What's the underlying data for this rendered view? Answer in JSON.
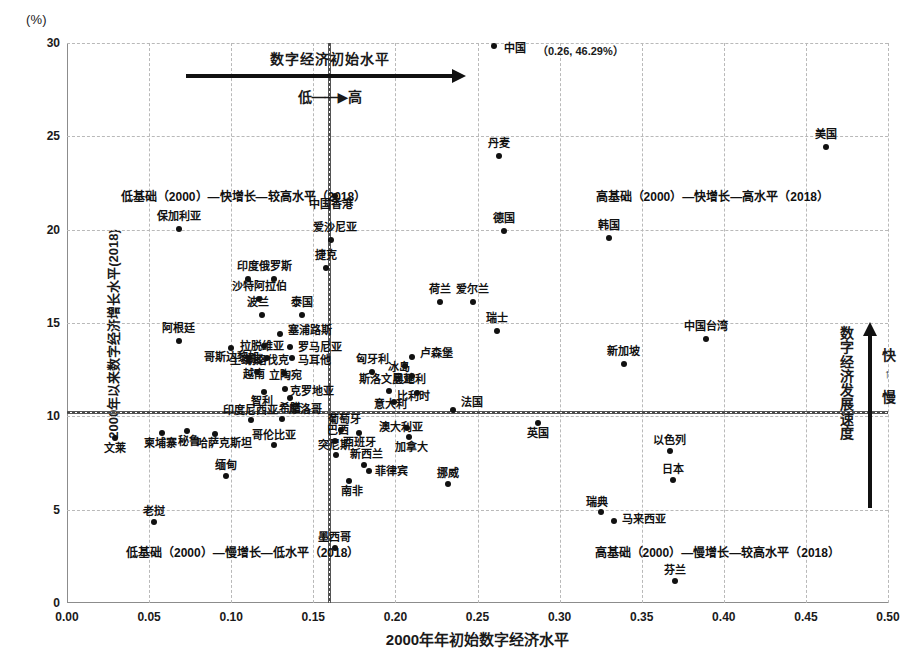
{
  "unit_label": "(%)",
  "axis": {
    "x_title": "2000年年初始数字经济水平",
    "y_title": "2000年以来数字经济增长水平(2018)",
    "x_ticks": [
      "0.00",
      "0.05",
      "0.10",
      "0.15",
      "0.20",
      "0.25",
      "0.30",
      "0.35",
      "0.40",
      "0.45",
      "0.50"
    ],
    "y_ticks": [
      "0",
      "5",
      "10",
      "15",
      "20",
      "25",
      "30"
    ]
  },
  "annotations": {
    "top_arrow_title": "数字经济初始水平",
    "top_arrow_sub_low": "低",
    "top_arrow_sub_dash": "——",
    "top_arrow_sub_arrow": "▶",
    "top_arrow_sub_high": "高",
    "right_arrow_title": "数字经济发展速度",
    "right_arrow_fast": "快",
    "right_arrow_updown": "↑",
    "right_arrow_slow": "慢",
    "quadrant_top_left": "低基础（2000）—快增长—较高水平（2018）",
    "quadrant_top_right": "高基础（2000）—快增长—高水平（2018）",
    "quadrant_bottom_left": "低基础（2000）—慢增长—低水平（2018）",
    "quadrant_bottom_right": "高基础（2000）—慢增长—较高水平（2018）",
    "china_name": "中国",
    "china_coord": "（0.26, 46.29%）"
  },
  "chart_data": {
    "type": "scatter",
    "title": "",
    "xlabel": "2000年年初始数字经济水平",
    "ylabel": "2000年以来数字经济增长水平(2018)",
    "xlim": [
      0.0,
      0.5
    ],
    "ylim": [
      0,
      30
    ],
    "grid": true,
    "legend": "none",
    "reference_lines": {
      "x": 0.16,
      "y": 10.2
    },
    "points": [
      {
        "label": "中国",
        "x": 0.26,
        "y": 29.85,
        "lx": 10,
        "ly": 2,
        "align": "right"
      },
      {
        "label": "丹麦",
        "x": 0.263,
        "y": 23.95,
        "lx": 0,
        "ly": -13,
        "align": "center"
      },
      {
        "label": "美国",
        "x": 0.462,
        "y": 24.45,
        "lx": 0,
        "ly": -13,
        "align": "center"
      },
      {
        "label": "中国香港",
        "x": 0.163,
        "y": 21.8,
        "lx": -4,
        "ly": 8,
        "align": "center"
      },
      {
        "label": "保加利亚",
        "x": 0.068,
        "y": 20.05,
        "lx": 0,
        "ly": -13,
        "align": "center"
      },
      {
        "label": "爱沙尼亚",
        "x": 0.161,
        "y": 19.45,
        "lx": 4,
        "ly": -13,
        "align": "center"
      },
      {
        "label": "德国",
        "x": 0.266,
        "y": 19.95,
        "lx": 0,
        "ly": -13,
        "align": "center"
      },
      {
        "label": "韩国",
        "x": 0.33,
        "y": 19.55,
        "lx": 0,
        "ly": -13,
        "align": "center"
      },
      {
        "label": "捷克",
        "x": 0.158,
        "y": 17.95,
        "lx": 0,
        "ly": -13,
        "align": "center"
      },
      {
        "label": "印度",
        "x": 0.11,
        "y": 17.35,
        "lx": 0,
        "ly": -13,
        "align": "center"
      },
      {
        "label": "俄罗斯",
        "x": 0.126,
        "y": 17.35,
        "lx": 2,
        "ly": -13,
        "align": "center"
      },
      {
        "label": "荷兰",
        "x": 0.227,
        "y": 16.15,
        "lx": 0,
        "ly": -13,
        "align": "center"
      },
      {
        "label": "爱尔兰",
        "x": 0.247,
        "y": 16.15,
        "lx": 0,
        "ly": -13,
        "align": "center"
      },
      {
        "label": "沙特阿拉伯",
        "x": 0.117,
        "y": 16.3,
        "lx": 0,
        "ly": -13,
        "align": "center"
      },
      {
        "label": "泰国",
        "x": 0.143,
        "y": 15.45,
        "lx": 0,
        "ly": -13,
        "align": "center"
      },
      {
        "label": "波兰",
        "x": 0.119,
        "y": 15.45,
        "lx": -4,
        "ly": -13,
        "align": "center"
      },
      {
        "label": "瑞士",
        "x": 0.262,
        "y": 14.55,
        "lx": 0,
        "ly": -13,
        "align": "center"
      },
      {
        "label": "中国台湾",
        "x": 0.389,
        "y": 14.15,
        "lx": 0,
        "ly": -13,
        "align": "center"
      },
      {
        "label": "阿根廷",
        "x": 0.068,
        "y": 14.05,
        "lx": 0,
        "ly": -13,
        "align": "center"
      },
      {
        "label": "塞浦路斯",
        "x": 0.13,
        "y": 14.4,
        "lx": 8,
        "ly": -4,
        "align": "right"
      },
      {
        "label": "哥斯达黎加",
        "x": 0.1,
        "y": 13.65,
        "lx": 0,
        "ly": 9,
        "align": "center"
      },
      {
        "label": "拉脱维亚",
        "x": 0.12,
        "y": 13.75,
        "lx": -2,
        "ly": 0,
        "align": "center"
      },
      {
        "label": "罗马尼亚",
        "x": 0.136,
        "y": 13.7,
        "lx": 8,
        "ly": 0,
        "align": "right"
      },
      {
        "label": "土耳其",
        "x": 0.111,
        "y": 13.1,
        "lx": -3,
        "ly": 2,
        "align": "center"
      },
      {
        "label": "斯洛伐克",
        "x": 0.122,
        "y": 13.1,
        "lx": 0,
        "ly": 2,
        "align": "center"
      },
      {
        "label": "马耳他",
        "x": 0.137,
        "y": 13.1,
        "lx": 6,
        "ly": 2,
        "align": "right"
      },
      {
        "label": "越南",
        "x": 0.116,
        "y": 12.35,
        "lx": -3,
        "ly": 2,
        "align": "center"
      },
      {
        "label": "立陶宛",
        "x": 0.132,
        "y": 12.3,
        "lx": 2,
        "ly": 2,
        "align": "center"
      },
      {
        "label": "新加坡",
        "x": 0.339,
        "y": 12.8,
        "lx": 0,
        "ly": -13,
        "align": "center"
      },
      {
        "label": "卢森堡",
        "x": 0.21,
        "y": 13.2,
        "lx": 8,
        "ly": -4,
        "align": "right"
      },
      {
        "label": "冰岛",
        "x": 0.206,
        "y": 12.7,
        "lx": -6,
        "ly": 1,
        "align": "center"
      },
      {
        "label": "奥地利",
        "x": 0.21,
        "y": 12.15,
        "lx": -2,
        "ly": 3,
        "align": "center"
      },
      {
        "label": "克罗地亚",
        "x": 0.133,
        "y": 11.45,
        "lx": 5,
        "ly": 2,
        "align": "right"
      },
      {
        "label": "智利",
        "x": 0.12,
        "y": 11.3,
        "lx": -2,
        "ly": 9,
        "align": "center"
      },
      {
        "label": "希腊",
        "x": 0.136,
        "y": 11.0,
        "lx": 0,
        "ly": 10,
        "align": "center"
      },
      {
        "label": "匈牙利",
        "x": 0.186,
        "y": 12.4,
        "lx": 0,
        "ly": -13,
        "align": "center"
      },
      {
        "label": "斯洛文尼亚",
        "x": 0.196,
        "y": 11.35,
        "lx": -2,
        "ly": -12,
        "align": "center"
      },
      {
        "label": "意大利",
        "x": 0.199,
        "y": 10.75,
        "lx": -3,
        "ly": 2,
        "align": "center"
      },
      {
        "label": "比利时",
        "x": 0.213,
        "y": 11.25,
        "lx": -3,
        "ly": 3,
        "align": "center"
      },
      {
        "label": "法国",
        "x": 0.235,
        "y": 10.35,
        "lx": 8,
        "ly": -8,
        "align": "right"
      },
      {
        "label": "英国",
        "x": 0.287,
        "y": 9.65,
        "lx": 0,
        "ly": 10,
        "align": "center"
      },
      {
        "label": "印度尼西亚",
        "x": 0.112,
        "y": 9.8,
        "lx": 0,
        "ly": -10,
        "align": "center"
      },
      {
        "label": "摩洛哥",
        "x": 0.131,
        "y": 9.85,
        "lx": 7,
        "ly": -10,
        "align": "right"
      },
      {
        "label": "葡萄牙",
        "x": 0.167,
        "y": 9.25,
        "lx": 3,
        "ly": -11,
        "align": "center"
      },
      {
        "label": "西班牙",
        "x": 0.178,
        "y": 9.1,
        "lx": 0,
        "ly": 9,
        "align": "center"
      },
      {
        "label": "澳大利亚",
        "x": 0.207,
        "y": 9.35,
        "lx": -6,
        "ly": -1,
        "align": "center"
      },
      {
        "label": "加拿大",
        "x": 0.208,
        "y": 8.9,
        "lx": 3,
        "ly": 10,
        "align": "center"
      },
      {
        "label": "文莱",
        "x": 0.029,
        "y": 8.85,
        "lx": 0,
        "ly": 10,
        "align": "center"
      },
      {
        "label": "柬埔寨",
        "x": 0.058,
        "y": 9.1,
        "lx": -2,
        "ly": 10,
        "align": "center"
      },
      {
        "label": "秘鲁",
        "x": 0.073,
        "y": 9.2,
        "lx": 2,
        "ly": 10,
        "align": "center"
      },
      {
        "label": "哈萨克斯坦",
        "x": 0.09,
        "y": 9.05,
        "lx": 10,
        "ly": 9,
        "align": "center"
      },
      {
        "label": "哥伦比亚",
        "x": 0.126,
        "y": 8.45,
        "lx": 0,
        "ly": -10,
        "align": "center"
      },
      {
        "label": "缅甸",
        "x": 0.097,
        "y": 6.8,
        "lx": 0,
        "ly": -11,
        "align": "center"
      },
      {
        "label": "巴西",
        "x": 0.163,
        "y": 8.7,
        "lx": 3,
        "ly": -11,
        "align": "center"
      },
      {
        "label": "突尼斯",
        "x": 0.164,
        "y": 7.95,
        "lx": -2,
        "ly": -10,
        "align": "center"
      },
      {
        "label": "新西兰",
        "x": 0.181,
        "y": 7.4,
        "lx": 2,
        "ly": -11,
        "align": "center"
      },
      {
        "label": "菲律宾",
        "x": 0.184,
        "y": 7.05,
        "lx": 6,
        "ly": 0,
        "align": "right"
      },
      {
        "label": "南非",
        "x": 0.172,
        "y": 6.55,
        "lx": 3,
        "ly": 10,
        "align": "center"
      },
      {
        "label": "挪威",
        "x": 0.232,
        "y": 6.4,
        "lx": 0,
        "ly": -11,
        "align": "center"
      },
      {
        "label": "以色列",
        "x": 0.367,
        "y": 8.15,
        "lx": 0,
        "ly": -11,
        "align": "center"
      },
      {
        "label": "日本",
        "x": 0.369,
        "y": 6.6,
        "lx": 0,
        "ly": -11,
        "align": "center"
      },
      {
        "label": "瑞典",
        "x": 0.325,
        "y": 4.85,
        "lx": -4,
        "ly": -10,
        "align": "center"
      },
      {
        "label": "马来西亚",
        "x": 0.333,
        "y": 4.4,
        "lx": 8,
        "ly": -2,
        "align": "right"
      },
      {
        "label": "芬兰",
        "x": 0.37,
        "y": 1.2,
        "lx": 0,
        "ly": -11,
        "align": "center"
      },
      {
        "label": "老挝",
        "x": 0.053,
        "y": 4.35,
        "lx": 0,
        "ly": -11,
        "align": "center"
      },
      {
        "label": "墨西哥",
        "x": 0.163,
        "y": 2.95,
        "lx": 0,
        "ly": -11,
        "align": "center"
      }
    ]
  }
}
